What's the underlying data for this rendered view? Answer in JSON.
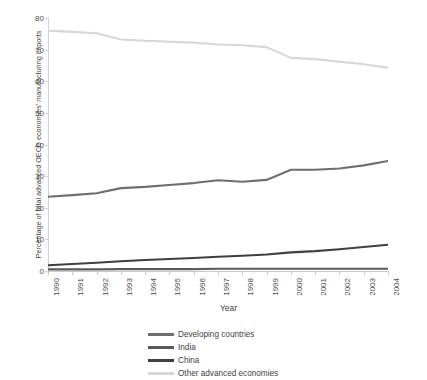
{
  "chart_data": {
    "type": "line",
    "title": "",
    "xlabel": "Year",
    "ylabel": "Percentage of total advanced OECD economies' manufacturing imports",
    "x": [
      1990,
      1991,
      1992,
      1993,
      1994,
      1995,
      1996,
      1997,
      1998,
      1999,
      2000,
      2001,
      2002,
      2003,
      2004
    ],
    "xticklabels": [
      "1990",
      "1991",
      "1992",
      "1993",
      "1994",
      "1995",
      "1996",
      "1997",
      "1998",
      "1999",
      "2000",
      "2001",
      "2002",
      "2003",
      "2004"
    ],
    "yticklabels": [
      "0",
      "10",
      "20",
      "30",
      "40",
      "50",
      "60",
      "70",
      "80"
    ],
    "yticks": [
      0,
      10,
      20,
      30,
      40,
      50,
      60,
      70,
      80
    ],
    "ylim": [
      0,
      80
    ],
    "xlim": [
      1990,
      2004
    ],
    "grid": false,
    "legend_position": "bottom",
    "series": [
      {
        "name": "Developing countries",
        "color": "#6e6e6e",
        "values": [
          23.5,
          24.0,
          24.6,
          26.2,
          26.6,
          27.2,
          27.8,
          28.7,
          28.2,
          28.8,
          32.0,
          32.0,
          32.4,
          33.4,
          34.8
        ]
      },
      {
        "name": "India",
        "color": "#5a5a5a",
        "values": [
          0.5,
          0.5,
          0.5,
          0.6,
          0.6,
          0.6,
          0.6,
          0.7,
          0.7,
          0.7,
          0.7,
          0.7,
          0.7,
          0.7,
          0.7
        ]
      },
      {
        "name": "China",
        "color": "#3f3f3f",
        "values": [
          1.8,
          2.2,
          2.6,
          3.1,
          3.5,
          3.8,
          4.1,
          4.5,
          4.8,
          5.2,
          5.9,
          6.3,
          6.9,
          7.6,
          8.3
        ]
      },
      {
        "name": "Other advanced economies",
        "color": "#d7d7d7",
        "values": [
          76.0,
          75.6,
          75.2,
          73.2,
          72.8,
          72.5,
          72.2,
          71.6,
          71.4,
          70.8,
          67.4,
          67.0,
          66.2,
          65.4,
          64.3
        ]
      }
    ]
  },
  "axes": {
    "y_title": "Percentage of total advanced OECD economies' manufacturing imports",
    "x_title": "Year"
  },
  "legend": {
    "items": [
      {
        "label": "Developing countries",
        "color": "#6e6e6e"
      },
      {
        "label": "India",
        "color": "#5a5a5a"
      },
      {
        "label": "China",
        "color": "#3f3f3f"
      },
      {
        "label": "Other advanced economies",
        "color": "#d7d7d7"
      }
    ]
  }
}
